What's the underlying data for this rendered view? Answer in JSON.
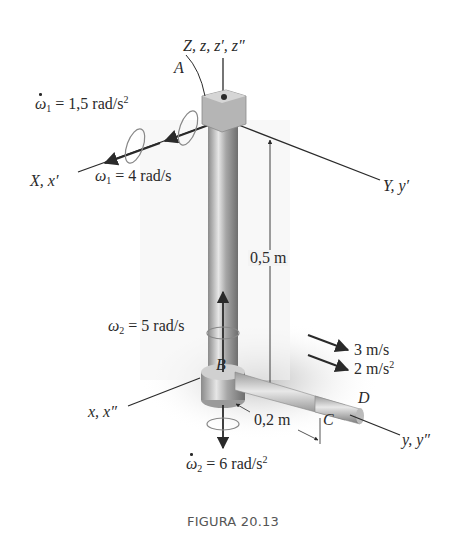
{
  "figure": {
    "caption": "FIGURA 20.13",
    "axes": {
      "z_axis": "Z, z, z′, z″",
      "x_upper": "X, x′",
      "y_upper": "Y, y′",
      "x_lower": "x, x″",
      "y_lower": "y, y″"
    },
    "points": {
      "A": "A",
      "B": "B",
      "C": "C",
      "D": "D"
    },
    "quantities": {
      "omega1_dot": {
        "symbol": "ω",
        "sub": "1",
        "eq": " = 1,5 rad/s",
        "sup": "2"
      },
      "omega1": {
        "symbol": "ω",
        "sub": "1",
        "eq": " = 4 rad/s"
      },
      "omega2": {
        "symbol": "ω",
        "sub": "2",
        "eq": " = 5 rad/s"
      },
      "omega2_dot": {
        "symbol": "ω",
        "sub": "2",
        "eq": " = 6 rad/s",
        "sup": "2"
      },
      "velocity": "3 m/s",
      "acceleration": {
        "text": "2 m/s",
        "sup": "2"
      },
      "length_vertical": "0,5 m",
      "length_horizontal": "0,2 m"
    },
    "colors": {
      "ink": "#2a2a2a",
      "metal_light": "#c8c8c8",
      "metal_dark": "#7a7a7a",
      "shadow": "#d9d9d9"
    }
  }
}
